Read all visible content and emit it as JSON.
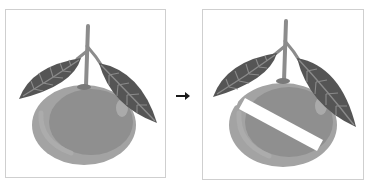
{
  "figure": {
    "panels": [
      {
        "id": "before",
        "subject": "tangerine-with-leaves",
        "state": "whole"
      },
      {
        "id": "after",
        "subject": "tangerine-with-leaves",
        "state": "sliced-diagonal-cut"
      }
    ],
    "arrow": {
      "icon": "right-arrow-icon",
      "glyph": "➜"
    },
    "colors": {
      "background": "#ffffff",
      "frame_border": "#cfcfcf",
      "leaf": "#555555",
      "leaf_vein": "#8a8a8a",
      "stem": "#8c8c8c",
      "fruit_rim": "#a3a3a3",
      "fruit_body": "#8f8f8f",
      "fruit_highlight": "#b3b3b3",
      "cut": "#ffffff",
      "arrow": "#1a1a1a"
    }
  }
}
